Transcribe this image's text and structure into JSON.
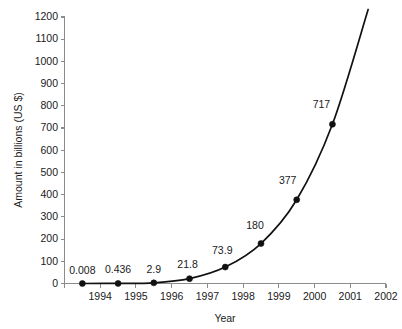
{
  "chart_data": {
    "type": "line",
    "title": "",
    "xlabel": "Year",
    "ylabel": "Amount in billions (US $)",
    "x": [
      1993.5,
      1994.5,
      1995.5,
      1996.5,
      1997.5,
      1998.5,
      1999.5,
      2000.5,
      2001.5
    ],
    "categories": [
      "1993",
      "1994",
      "1995",
      "1996",
      "1997",
      "1998",
      "1999",
      "2000",
      "2001"
    ],
    "values": [
      0.008,
      0.436,
      2.9,
      21.8,
      73.9,
      180,
      377,
      717,
      1234
    ],
    "point_labels": [
      "0.008",
      "0.436",
      "2.9",
      "21.8",
      "73.9",
      "180",
      "377",
      "717",
      "1234"
    ],
    "xlim": [
      1993,
      2002
    ],
    "ylim": [
      0,
      1200
    ],
    "ytick_values": [
      0,
      100,
      200,
      300,
      400,
      500,
      600,
      700,
      800,
      900,
      1000,
      1100,
      1200
    ],
    "ytick_labels": [
      "0",
      "100",
      "200",
      "300",
      "400",
      "500",
      "600",
      "700",
      "800",
      "900",
      "1000",
      "1100",
      "1200"
    ],
    "xtick_values": [
      1993,
      1994,
      1995,
      1996,
      1997,
      1998,
      1999,
      2000,
      2001,
      2002
    ],
    "xtick_labels": [
      "1994",
      "1995",
      "1996",
      "1997",
      "1998",
      "1999",
      "2000",
      "2001",
      "2002"
    ],
    "grid": false,
    "legend": false,
    "series": [
      {
        "name": "Amount in billions (US $)",
        "values": [
          0.008,
          0.436,
          2.9,
          21.8,
          73.9,
          180,
          377,
          717,
          1234
        ],
        "color": "#111111",
        "marker": "filled-circle"
      }
    ],
    "colors": {
      "line": "#111111",
      "marker": "#111111",
      "axis": "#8c8c8c",
      "text": "#1a1a1a",
      "background": "#ffffff"
    }
  }
}
